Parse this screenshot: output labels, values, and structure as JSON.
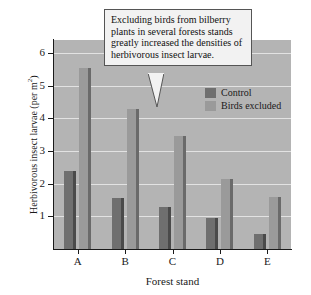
{
  "callout": {
    "text": "Excluding birds from bilberry plants in several forests stands greatly increased the densities of herbivorous insect larvae."
  },
  "legend": {
    "items": [
      {
        "label": "Control",
        "color": "#6f6f6f"
      },
      {
        "label": "Birds excluded",
        "color": "#9a9a9a"
      }
    ]
  },
  "axes": {
    "y_title_main": "Herbivorous insect larvae (per m",
    "y_title_sup": "2",
    "y_title_close": ")",
    "x_title": "Forest stand",
    "y_ticks": [
      "6",
      "5",
      "4",
      "3",
      "2",
      "1"
    ],
    "x_ticks": [
      "A",
      "B",
      "C",
      "D",
      "E"
    ]
  },
  "chart_data": {
    "type": "bar",
    "title": "",
    "xlabel": "Forest stand",
    "ylabel": "Herbivorous insect larvae (per m2)",
    "categories": [
      "A",
      "B",
      "C",
      "D",
      "E"
    ],
    "series": [
      {
        "name": "Control",
        "color": "#6f6f6f",
        "values": [
          2.4,
          1.55,
          1.3,
          0.95,
          0.45
        ]
      },
      {
        "name": "Birds excluded",
        "color": "#9a9a9a",
        "values": [
          5.55,
          4.3,
          3.45,
          2.15,
          1.6
        ]
      }
    ],
    "ylim": [
      0,
      6.4
    ],
    "yticks": [
      1,
      2,
      3,
      4,
      5,
      6
    ],
    "grid": true,
    "legend_position": "inside-top-right"
  }
}
